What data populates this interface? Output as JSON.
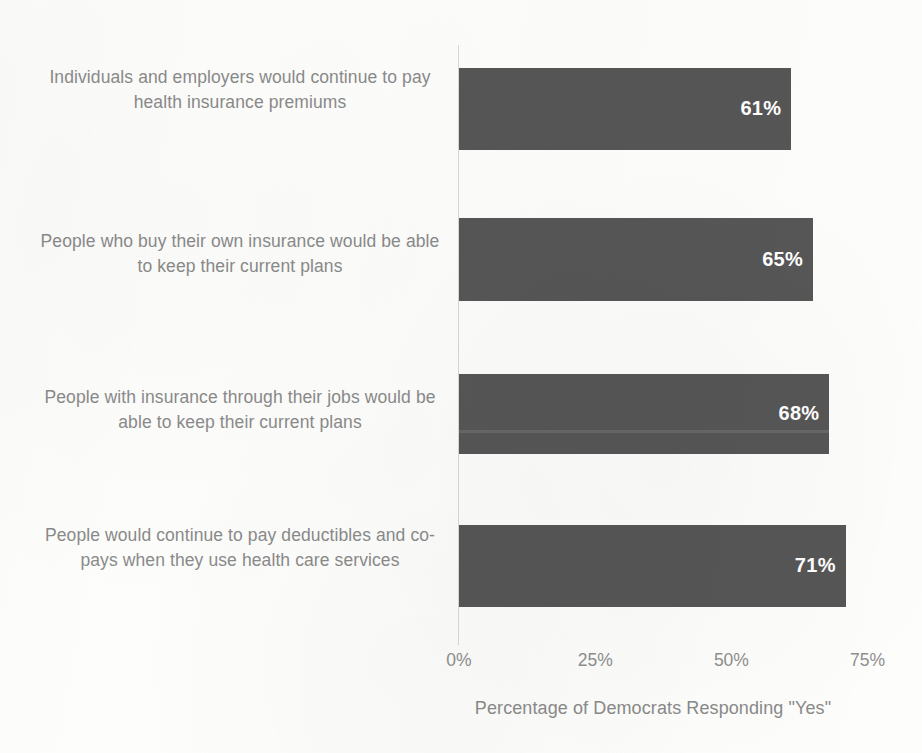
{
  "chart_data": {
    "type": "bar",
    "orientation": "horizontal",
    "title": "",
    "xlabel": "Percentage of Democrats Responding \"Yes\"",
    "ylabel": "",
    "xlim": [
      0,
      75
    ],
    "xticks": [
      "0%",
      "25%",
      "50%",
      "75%"
    ],
    "xtick_values": [
      0,
      25,
      50,
      75
    ],
    "grid": false,
    "legend": "none",
    "bar_color": "#565656",
    "label_color": "#8a8a8a",
    "value_label_color": "#ffffff",
    "categories": [
      "Individuals and employers would continue to pay health insurance premiums",
      "People who buy their own insurance would be able to keep their current plans",
      "People with insurance through their jobs would be able to keep their current plans",
      "People would continue to pay deductibles and co-pays when they use health care services"
    ],
    "values": [
      61,
      65,
      68,
      71
    ],
    "value_labels": [
      "61%",
      "65%",
      "68%",
      "71%"
    ]
  }
}
